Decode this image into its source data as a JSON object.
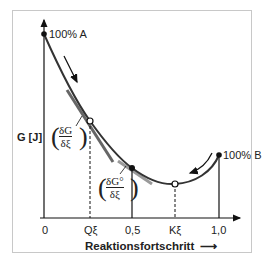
{
  "diagram": {
    "y_axis_label": "G [J]",
    "x_axis_label": "Reaktionsfortschritt",
    "x_axis_arrow": "⟶",
    "tick_labels": [
      "0",
      "Qξ",
      "0,5",
      "Kξ",
      "1,0"
    ],
    "point_labels": {
      "start": "100% A",
      "end": "100% B"
    },
    "tangent_labels": {
      "at_Q": {
        "numerator": "δG",
        "denominator": "δξ"
      },
      "at_half": {
        "numerator": "δG°",
        "denominator": "δξ"
      }
    },
    "colors": {
      "curve": "#333333",
      "tangent": "#707070",
      "tangent_light": "#9a9a9a",
      "axis": "#111111",
      "frame": "#c8c8c8"
    }
  }
}
